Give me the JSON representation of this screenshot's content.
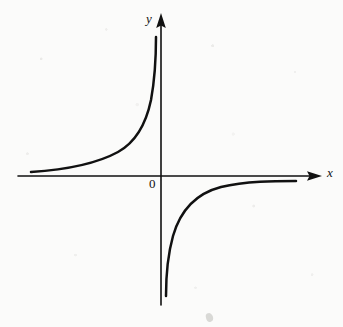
{
  "figure": {
    "background_color": "#fbfbfa",
    "ink_color": "#111111"
  },
  "labels": {
    "y_axis": "y",
    "x_axis": "x",
    "origin": "0"
  },
  "chart_data": {
    "type": "line",
    "title": "",
    "subtitle": "",
    "xlabel": "x",
    "ylabel": "y",
    "function": "y = k / x, k < 0",
    "xlim": [
      -6.2,
      5.2
    ],
    "ylim": [
      -5.0,
      4.3
    ],
    "grid": false,
    "legend": null,
    "axes": {
      "origin_label": "0",
      "x_axis_arrow": true,
      "y_axis_arrow": true,
      "x_axis_pixel_span": [
        18,
        322
      ],
      "y_axis_pixel_span": [
        13,
        305
      ],
      "origin_pixel": [
        161,
        176
      ],
      "tick_labels_x": [],
      "tick_labels_y": []
    },
    "asymptotes": {
      "vertical": "x = 0",
      "horizontal": "y = 0"
    },
    "series": [
      {
        "name": "upper-left branch (quadrant II)",
        "quadrant": "II",
        "x": [
          -6.0,
          -5.0,
          -4.2,
          -3.5,
          -3.0,
          -2.5,
          -2.1,
          -1.8,
          -1.5,
          -1.25,
          -1.05,
          -0.9,
          -0.78,
          -0.68,
          -0.6,
          -0.52,
          -0.46,
          -0.41,
          -0.37,
          -0.33,
          -0.3,
          -0.27,
          -0.25
        ],
        "y": [
          0.12,
          0.15,
          0.18,
          0.21,
          0.25,
          0.3,
          0.36,
          0.42,
          0.5,
          0.6,
          0.71,
          0.83,
          0.96,
          1.1,
          1.25,
          1.44,
          1.63,
          1.83,
          2.03,
          2.27,
          2.5,
          2.78,
          3.0
        ]
      },
      {
        "name": "lower-right branch (quadrant IV)",
        "quadrant": "IV",
        "x": [
          0.22,
          0.25,
          0.28,
          0.32,
          0.37,
          0.43,
          0.5,
          0.6,
          0.72,
          0.88,
          1.08,
          1.35,
          1.7,
          2.1,
          2.6,
          3.2,
          3.8,
          4.4,
          5.0
        ],
        "y": [
          -3.4,
          -3.0,
          -2.7,
          -2.35,
          -2.05,
          -1.75,
          -1.5,
          -1.25,
          -1.05,
          -0.86,
          -0.7,
          -0.56,
          -0.44,
          -0.36,
          -0.29,
          -0.23,
          -0.2,
          -0.17,
          -0.15
        ]
      }
    ],
    "curve_pixel_paths": {
      "upper_left_branch": "M 31,172 C 62,170 96,164 118,152 C 136,142 146,124 151,100 C 155,78 156,54 156,37",
      "lower_right_branch": "M 166,296 C 166,278 168,254 173,236 C 181,208 198,193 221,187 C 246,181 275,181 296,181"
    }
  }
}
